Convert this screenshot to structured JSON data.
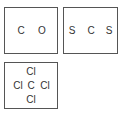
{
  "diagram": {
    "type": "lewis-structure-skeletons",
    "boxes": [
      {
        "name": "carbon-monoxide",
        "atoms": [
          "C",
          "O"
        ]
      },
      {
        "name": "carbon-disulfide",
        "atoms": [
          "S",
          "C",
          "S"
        ]
      },
      {
        "name": "carbon-tetrachloride",
        "atoms": {
          "top": "Cl",
          "left": "Cl",
          "center": "C",
          "right": "Cl",
          "bottom": "Cl"
        }
      }
    ],
    "colors": {
      "border": "#555555",
      "text": "#333333",
      "background": "#ffffff"
    }
  }
}
